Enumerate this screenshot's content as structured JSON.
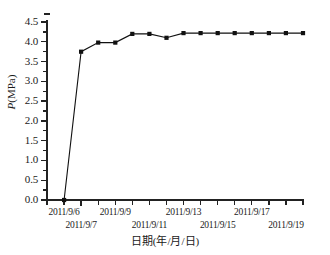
{
  "chart_data": {
    "type": "line",
    "title": "",
    "subtitle": "",
    "xlabel": "日期(年/月/日)",
    "ylabel": "P(MPa)",
    "ylabel_italic_part": "P",
    "ylabel_rest": "(MPa)",
    "xlim": [
      "2011/9/5",
      "2011/9/20"
    ],
    "ylim": [
      0.0,
      4.5
    ],
    "ytick_labels": [
      "0.0",
      "0.5",
      "1.0",
      "1.5",
      "2.0",
      "2.5",
      "3.0",
      "3.5",
      "4.0",
      "4.5"
    ],
    "ytick_values": [
      0.0,
      0.5,
      1.0,
      1.5,
      2.0,
      2.5,
      3.0,
      3.5,
      4.0,
      4.5
    ],
    "ytick_interval": 0.5,
    "xtick_labels_row1": [
      "2011/9/6",
      "2011/9/9",
      "2011/9/13",
      "2011/9/17"
    ],
    "xtick_labels_row2": [
      "2011/9/7",
      "2011/9/11",
      "2011/9/15",
      "2011/9/19"
    ],
    "xtick_labels_all": [
      "2011/9/6",
      "2011/9/7",
      "2011/9/9",
      "2011/9/11",
      "2011/9/13",
      "2011/9/15",
      "2011/9/17",
      "2011/9/19"
    ],
    "grid": false,
    "legend": null,
    "marker": "filled-square",
    "line_color": "#111111",
    "marker_color": "#111111",
    "x": [
      "2011/9/6",
      "2011/9/7",
      "2011/9/8",
      "2011/9/9",
      "2011/9/10",
      "2011/9/11",
      "2011/9/12",
      "2011/9/13",
      "2011/9/14",
      "2011/9/15",
      "2011/9/16",
      "2011/9/17",
      "2011/9/18",
      "2011/9/19",
      "2011/9/20"
    ],
    "values": [
      0.0,
      3.75,
      3.98,
      3.98,
      4.2,
      4.2,
      4.1,
      4.22,
      4.22,
      4.22,
      4.22,
      4.22,
      4.22,
      4.22,
      4.22
    ],
    "series": [
      {
        "name": "P",
        "values": [
          0.0,
          3.75,
          3.98,
          3.98,
          4.2,
          4.2,
          4.1,
          4.22,
          4.22,
          4.22,
          4.22,
          4.22,
          4.22,
          4.22,
          4.22
        ]
      }
    ],
    "annotations": []
  }
}
